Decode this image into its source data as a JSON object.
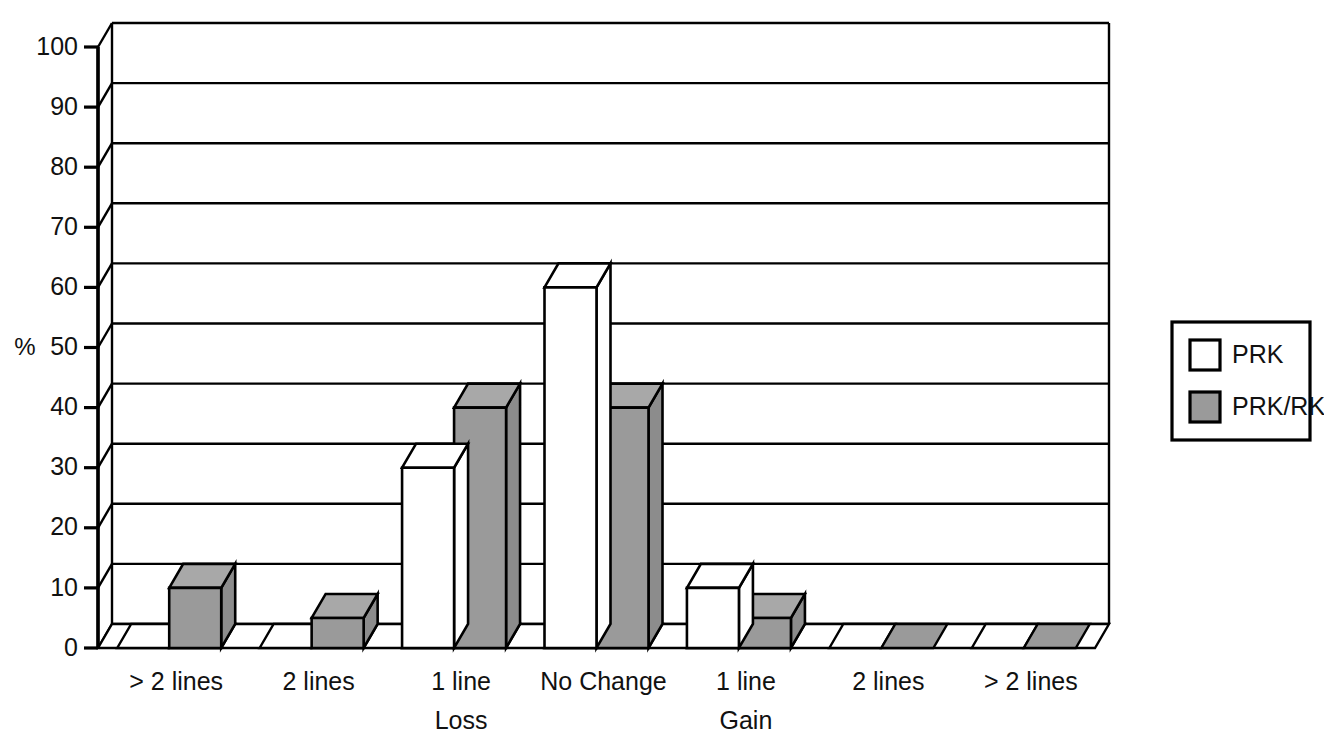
{
  "chart_data": {
    "type": "bar",
    "title": "",
    "subtitle": "",
    "xlabel": "",
    "ylabel": "%",
    "ylim": [
      0,
      100
    ],
    "ytick_step": 10,
    "ytick_labels": [
      "0",
      "10",
      "20",
      "30",
      "40",
      "50",
      "60",
      "70",
      "80",
      "90",
      "100"
    ],
    "categories": [
      "> 2 lines",
      "2 lines",
      "1 line",
      "No Change",
      "1 line",
      "2 lines",
      "> 2 lines"
    ],
    "group_labels": [
      "Loss",
      "Gain"
    ],
    "group_label_positions": [
      2,
      4
    ],
    "series": [
      {
        "name": "PRK",
        "color": "#ffffff",
        "values": [
          0,
          0,
          30,
          60,
          10,
          0,
          0
        ]
      },
      {
        "name": "PRK/RK",
        "color": "#9a9a9a",
        "values": [
          10,
          5,
          40,
          40,
          5,
          0,
          0
        ]
      }
    ],
    "legend_entries": [
      "PRK",
      "PRK/RK"
    ],
    "legend_position": "right",
    "grid": true,
    "grid_orientation": "horizontal",
    "style": "3d-isometric",
    "bar_fill_white": "#ffffff",
    "bar_fill_gray": "#9a9a9a",
    "bar_fill_gray_top": "#a8a8a8",
    "bar_fill_gray_side": "#8c8c8c",
    "outline_color": "#000000",
    "background_color": "#ffffff"
  },
  "axis": {
    "unit_label": "%",
    "ticks": [
      {
        "value": 100,
        "label": "100"
      },
      {
        "value": 90,
        "label": "90"
      },
      {
        "value": 80,
        "label": "80"
      },
      {
        "value": 70,
        "label": "70"
      },
      {
        "value": 60,
        "label": "60"
      },
      {
        "value": 50,
        "label": "50"
      },
      {
        "value": 40,
        "label": "40"
      },
      {
        "value": 30,
        "label": "30"
      },
      {
        "value": 20,
        "label": "20"
      },
      {
        "value": 10,
        "label": "10"
      },
      {
        "value": 0,
        "label": "0"
      }
    ]
  },
  "categories_axis": {
    "labels": [
      "> 2 lines",
      "2 lines",
      "1 line",
      "No Change",
      "1 line",
      "2 lines",
      "> 2 lines"
    ],
    "sub_labels": [
      {
        "text": "Loss",
        "index": 2
      },
      {
        "text": "Gain",
        "index": 4
      }
    ]
  },
  "legend": {
    "items": [
      {
        "label": "PRK",
        "swatch": "white"
      },
      {
        "label": "PRK/RK",
        "swatch": "gray"
      }
    ]
  }
}
